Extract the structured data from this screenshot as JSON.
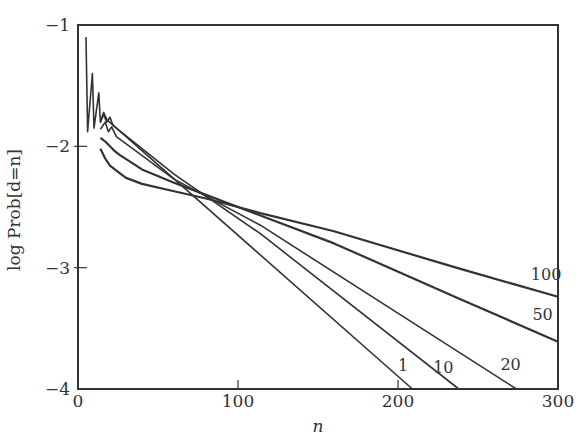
{
  "chart_data": {
    "type": "line",
    "title": "",
    "xlabel": "n",
    "ylabel": "log Prob[d=n]",
    "xlim": [
      0,
      300
    ],
    "ylim": [
      -4,
      -1
    ],
    "xticks": [
      0,
      100,
      200,
      300
    ],
    "yticks": [
      -1,
      -2,
      -3,
      -4
    ],
    "xtick_labels": [
      "0",
      "100",
      "200",
      "300"
    ],
    "ytick_labels": [
      "−1",
      "−2",
      "−3",
      "−4"
    ],
    "grid": false,
    "legend": "inline labels at line ends",
    "series": [
      {
        "name": "1",
        "label_pos": [
          200,
          -3.85
        ],
        "points": [
          [
            5,
            -1.1
          ],
          [
            6,
            -1.88
          ],
          [
            9,
            -1.4
          ],
          [
            10,
            -1.85
          ],
          [
            13,
            -1.56
          ],
          [
            14,
            -1.8
          ],
          [
            16,
            -1.72
          ],
          [
            18,
            -1.78
          ],
          [
            209,
            -4.0
          ]
        ]
      },
      {
        "name": "10",
        "label_pos": [
          222,
          -3.87
        ],
        "points": [
          [
            14,
            -1.8
          ],
          [
            16,
            -1.74
          ],
          [
            18,
            -1.8
          ],
          [
            20,
            -1.76
          ],
          [
            22,
            -1.83
          ],
          [
            60,
            -2.23
          ],
          [
            114,
            -2.72
          ],
          [
            238,
            -4.0
          ]
        ]
      },
      {
        "name": "20",
        "label_pos": [
          264,
          -3.84
        ],
        "points": [
          [
            14,
            -1.86
          ],
          [
            17,
            -1.8
          ],
          [
            19,
            -1.88
          ],
          [
            21,
            -1.84
          ],
          [
            24,
            -1.92
          ],
          [
            60,
            -2.27
          ],
          [
            114,
            -2.65
          ],
          [
            274,
            -4.0
          ]
        ]
      },
      {
        "name": "50",
        "label_pos": [
          284,
          -3.43
        ],
        "points": [
          [
            14,
            -1.93
          ],
          [
            17,
            -1.96
          ],
          [
            20,
            -2.0
          ],
          [
            23,
            -2.04
          ],
          [
            26,
            -2.07
          ],
          [
            40,
            -2.19
          ],
          [
            60,
            -2.3
          ],
          [
            80,
            -2.4
          ],
          [
            114,
            -2.57
          ],
          [
            160,
            -2.8
          ],
          [
            239,
            -3.26
          ],
          [
            300,
            -3.61
          ]
        ]
      },
      {
        "name": "100",
        "label_pos": [
          283,
          -3.1
        ],
        "points": [
          [
            14,
            -2.02
          ],
          [
            17,
            -2.1
          ],
          [
            20,
            -2.16
          ],
          [
            25,
            -2.21
          ],
          [
            30,
            -2.26
          ],
          [
            40,
            -2.31
          ],
          [
            60,
            -2.37
          ],
          [
            80,
            -2.43
          ],
          [
            100,
            -2.5
          ],
          [
            114,
            -2.55
          ],
          [
            160,
            -2.7
          ],
          [
            239,
            -3.01
          ],
          [
            300,
            -3.24
          ]
        ]
      }
    ],
    "annotations": [
      "1",
      "10",
      "20",
      "50",
      "100"
    ]
  }
}
